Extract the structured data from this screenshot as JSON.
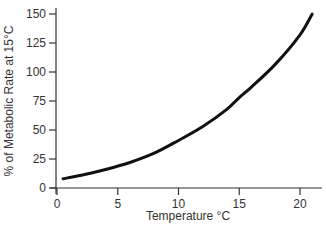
{
  "chart_data": {
    "type": "line",
    "title": "",
    "xlabel": "Temperature °C",
    "ylabel": "% of Metabolic Rate at 15°C",
    "xlim": [
      0,
      21.5
    ],
    "ylim": [
      0,
      150
    ],
    "xticks": [
      0,
      5,
      10,
      15,
      20
    ],
    "yticks": [
      0,
      25,
      50,
      75,
      100,
      125,
      150
    ],
    "grid": false,
    "series": [
      {
        "name": "Metabolic rate",
        "x": [
          0.5,
          2,
          4,
          6,
          8,
          10,
          12,
          14,
          15,
          16,
          18,
          20,
          21
        ],
        "y": [
          8,
          11,
          16,
          22,
          30,
          41,
          53,
          68,
          78,
          87,
          107,
          132,
          150
        ]
      }
    ]
  }
}
